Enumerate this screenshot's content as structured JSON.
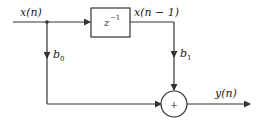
{
  "diagram": {
    "type": "signal-flow",
    "colors": {
      "line": "#333333",
      "background": "#ffffff"
    },
    "input_label": "x(n)",
    "delay_block": {
      "label_base": "z",
      "label_exp": "−1"
    },
    "delayed_label": "x(n − 1)",
    "coefficients": [
      {
        "name": "b",
        "sub": "0"
      },
      {
        "name": "b",
        "sub": "1"
      }
    ],
    "adder_symbol": "+",
    "output_label": "y(n)"
  }
}
